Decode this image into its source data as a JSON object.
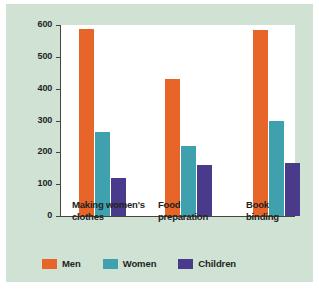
{
  "chart_data": {
    "type": "bar",
    "title": "",
    "xlabel": "",
    "ylabel": "Annual earnings (in dollars)",
    "categories": [
      "Making women's\nclothes",
      "Food\npreparation",
      "Book\nbinding"
    ],
    "series": [
      {
        "name": "Men",
        "color": "#e8652a",
        "values": [
          587,
          430,
          583
        ]
      },
      {
        "name": "Women",
        "color": "#3fa0ae",
        "values": [
          264,
          219,
          299
        ]
      },
      {
        "name": "Children",
        "color": "#4a3a8c",
        "values": [
          119,
          161,
          167
        ]
      }
    ],
    "ylim": [
      0,
      600
    ],
    "yticks": [
      600,
      500,
      400,
      300,
      200,
      100,
      0
    ],
    "ytick_labels": [
      "600",
      "500",
      "400",
      "300",
      "200",
      "100",
      "0"
    ],
    "grid": false,
    "legend_position": "bottom"
  },
  "colors": {
    "background": "#cfe2d4",
    "plot_background": "#ffffff",
    "axis": "#44463f",
    "text": "#231f1c",
    "men": "#e8652a",
    "women": "#3fa0ae",
    "children": "#4a3a8c"
  }
}
